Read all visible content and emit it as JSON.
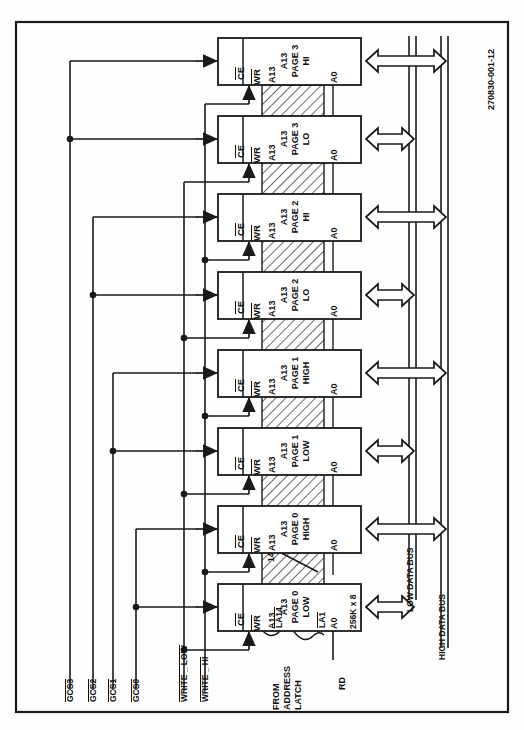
{
  "figure": {
    "doc_id": "270830-001-12",
    "frame": {
      "border_color": "#1a1a1a"
    }
  },
  "colors": {
    "line": "#1a1a1a",
    "hatch": "#1a1a1a",
    "background": "#ffffff"
  },
  "blocks": [
    {
      "id": "page3hi",
      "ce": "CE",
      "wr": "WR",
      "addr_hi": "A13",
      "addr_lo": "A0",
      "name_line1": "A13",
      "name_line2": "PAGE 3",
      "name_line3": "HI",
      "bus": "high"
    },
    {
      "id": "page3lo",
      "ce": "CE",
      "wr": "WR",
      "addr_hi": "A13",
      "addr_lo": "A0",
      "name_line1": "A13",
      "name_line2": "PAGE 3",
      "name_line3": "LO",
      "bus": "low"
    },
    {
      "id": "page2hi",
      "ce": "CE",
      "wr": "WR",
      "addr_hi": "A13",
      "addr_lo": "A0",
      "name_line1": "A13",
      "name_line2": "PAGE 2",
      "name_line3": "HI",
      "bus": "high"
    },
    {
      "id": "page2lo",
      "ce": "CE",
      "wr": "WR",
      "addr_hi": "A13",
      "addr_lo": "A0",
      "name_line1": "A13",
      "name_line2": "PAGE 2",
      "name_line3": "LO",
      "bus": "low"
    },
    {
      "id": "page1high",
      "ce": "CE",
      "wr": "WR",
      "addr_hi": "A13",
      "addr_lo": "A0",
      "name_line1": "A13",
      "name_line2": "PAGE 1",
      "name_line3": "HIGH",
      "bus": "high"
    },
    {
      "id": "page1low",
      "ce": "CE",
      "wr": "WR",
      "addr_hi": "A13",
      "addr_lo": "A0",
      "name_line1": "A13",
      "name_line2": "PAGE 1",
      "name_line3": "LOW",
      "bus": "low"
    },
    {
      "id": "page0high",
      "ce": "CE",
      "wr": "WR",
      "addr_hi": "A13",
      "addr_lo": "A0",
      "name_line1": "A13",
      "name_line2": "PAGE 0",
      "name_line3": "HIGH",
      "bus": "high"
    },
    {
      "id": "page0low",
      "ce": "CE",
      "wr": "WR",
      "addr_hi": "A13",
      "addr_lo": "A0",
      "name_line1": "A13",
      "name_line2": "PAGE 0",
      "name_line3": "LOW",
      "bus": "low"
    }
  ],
  "left_signals": [
    {
      "id": "gcs3",
      "label": "GCS3"
    },
    {
      "id": "gcs2",
      "label": "GCS2"
    },
    {
      "id": "gcs1",
      "label": "GCS1"
    },
    {
      "id": "gcs0",
      "label": "GCS0"
    },
    {
      "id": "write_low",
      "label": "WRITE _ LOW"
    },
    {
      "id": "write_hi",
      "label": "WRITE _ HI"
    }
  ],
  "right_buses": [
    {
      "id": "low_data_bus",
      "label": "LOW DATA BUS"
    },
    {
      "id": "high_data_bus",
      "label": "HIGH DATA BUS"
    }
  ],
  "address_bus": {
    "source_line1": "FROM",
    "source_line2": "ADDRESS",
    "source_line3": "LATCH",
    "top_signal": "LA14",
    "bottom_signal": "LA1",
    "width": "14"
  },
  "read_signal": {
    "label": "RD"
  },
  "memory_size": {
    "label": "256K x 8"
  }
}
